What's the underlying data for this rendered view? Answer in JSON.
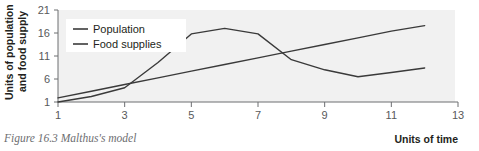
{
  "figure": {
    "caption": "Figure 16.3 Malthus's model",
    "plot_background": "#f1f1f1",
    "line_color": "#3a3a3a",
    "tick_label_color": "#58595b",
    "caption_color": "#6d6e71"
  },
  "chart_data": {
    "type": "line",
    "title": "",
    "xlabel": "Units of time",
    "ylabel": "Units of population and food supply",
    "ylabel_line1": "Units of population",
    "ylabel_line2": "and food supply",
    "xlim": [
      1,
      13
    ],
    "ylim": [
      1,
      21
    ],
    "xticks": [
      1,
      3,
      5,
      7,
      9,
      11,
      13
    ],
    "yticks": [
      1,
      6,
      11,
      16,
      21
    ],
    "xtick_labels": [
      "1",
      "3",
      "5",
      "7",
      "9",
      "11",
      "13"
    ],
    "ytick_labels": [
      "1",
      "6",
      "11",
      "16",
      "21"
    ],
    "grid": false,
    "legend_position": "upper-left",
    "x": [
      1,
      2,
      3,
      4,
      5,
      6,
      7,
      8,
      9,
      10,
      11,
      12
    ],
    "series": [
      {
        "name": "Population",
        "values": [
          1,
          2.2,
          4.1,
          9.6,
          15.8,
          17.0,
          15.8,
          10.2,
          8.0,
          6.5,
          7.4,
          8.4
        ]
      },
      {
        "name": "Food supplies",
        "values": [
          1.9,
          3.35,
          4.8,
          6.25,
          7.7,
          9.15,
          10.6,
          12.05,
          13.5,
          14.95,
          16.4,
          17.6
        ]
      }
    ]
  },
  "legend": {
    "items": [
      {
        "label": "Population"
      },
      {
        "label": "Food supplies"
      }
    ]
  }
}
